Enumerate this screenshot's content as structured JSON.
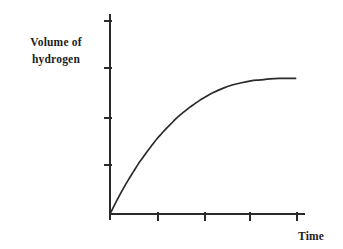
{
  "figure": {
    "width": 343,
    "height": 249,
    "background": "#ffffff",
    "ink_color": "#2a2a2a",
    "text_color": "#1c1c1c"
  },
  "labels": {
    "ylabel_line1": "Volume of",
    "ylabel_line2": "hydrogen",
    "xlabel": "Time"
  },
  "chart_data": {
    "type": "line",
    "title": "",
    "subtitle": "",
    "xlabel": "Time",
    "ylabel": "Volume of hydrogen",
    "grid": false,
    "legend": false,
    "legend_position": "none",
    "axis_style": "L-shaped spines, unlabeled tick marks",
    "xlim": [
      0,
      4.15
    ],
    "ylim": [
      0,
      4.25
    ],
    "xticks": [
      1,
      2,
      3,
      4
    ],
    "xticklabels": [
      "",
      "",
      "",
      ""
    ],
    "yticks": [
      1,
      2,
      3,
      4
    ],
    "yticklabels": [
      "",
      "",
      "",
      ""
    ],
    "series": [
      {
        "name": "hydrogen volume",
        "color": "#2a2a2a",
        "linewidth": 1.7,
        "description": "Reaction curve rising steeply from the origin then levelling off to a horizontal plateau (saturation).",
        "x": [
          0.0,
          0.1,
          0.2,
          0.3,
          0.4,
          0.5,
          0.6,
          0.7,
          0.8,
          0.9,
          1.0,
          1.1,
          1.2,
          1.3,
          1.4,
          1.5,
          1.6,
          1.7,
          1.8,
          1.9,
          2.0,
          2.2,
          2.4,
          2.6,
          2.8,
          3.0,
          3.2,
          3.4,
          3.6,
          3.8,
          3.95
        ],
        "y": [
          0.0,
          0.2,
          0.39,
          0.57,
          0.74,
          0.9,
          1.06,
          1.2,
          1.34,
          1.47,
          1.6,
          1.71,
          1.82,
          1.92,
          2.02,
          2.11,
          2.19,
          2.27,
          2.34,
          2.41,
          2.47,
          2.58,
          2.67,
          2.74,
          2.79,
          2.83,
          2.85,
          2.87,
          2.88,
          2.88,
          2.88
        ],
        "plateau_value": 2.88
      }
    ],
    "annotations": []
  }
}
